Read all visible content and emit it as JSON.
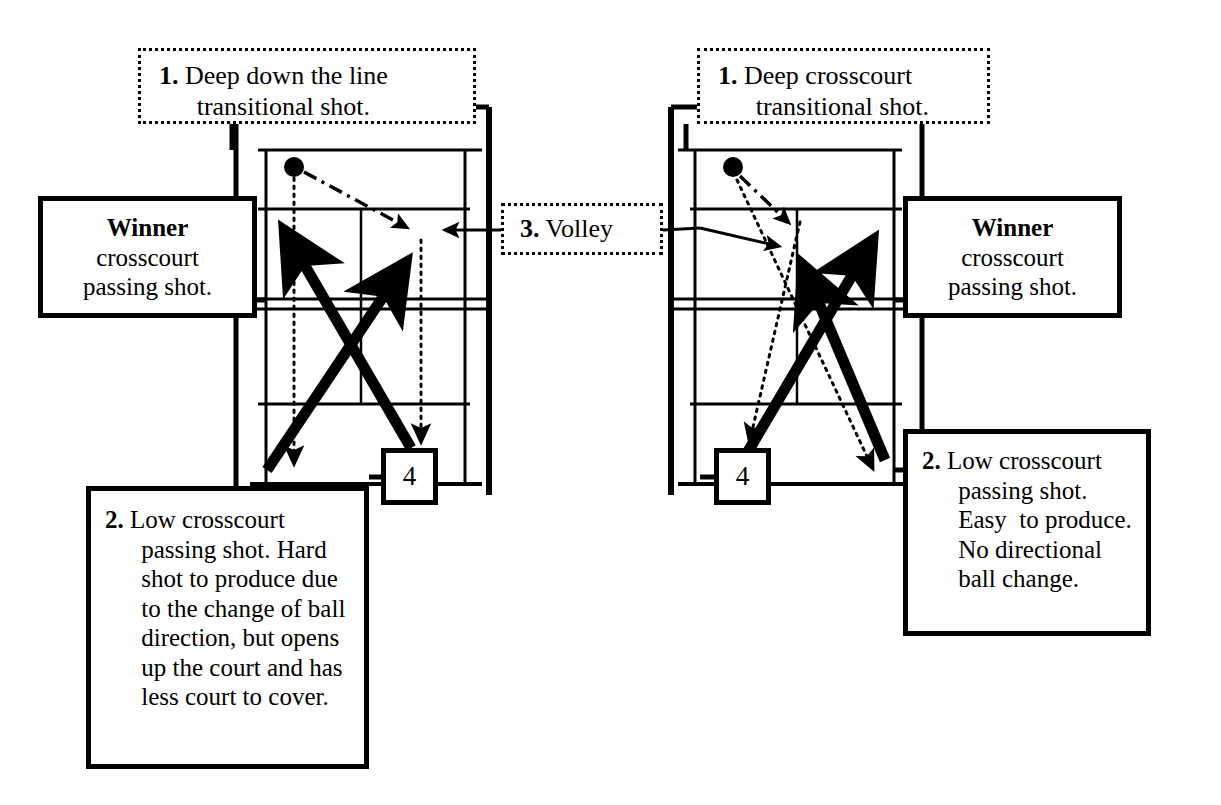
{
  "diagram": {
    "ink_color": "#000000",
    "background_color": "#ffffff"
  },
  "left_panel": {
    "callout_1": {
      "number": "1.",
      "text": "Deep down the line transitional shot.",
      "line1": "Deep down the line",
      "line2": "transitional shot.",
      "border_style": "dotted"
    },
    "winner_box": {
      "heading": "Winner",
      "line2": "crosscourt",
      "line3": "passing shot.",
      "border_style": "solid"
    },
    "callout_2": {
      "number": "2.",
      "text": "Low crosscourt passing shot. Hard shot to produce due to the change of ball direction, but opens up the court and has less court to cover.",
      "border_style": "solid"
    },
    "marker": {
      "label": "4"
    }
  },
  "center": {
    "callout_3": {
      "number": "3.",
      "text": "Volley",
      "border_style": "dotted"
    }
  },
  "right_panel": {
    "callout_1": {
      "number": "1.",
      "text": "Deep crosscourt transitional shot.",
      "line1": "Deep crosscourt",
      "line2": "transitional shot.",
      "border_style": "dotted"
    },
    "winner_box": {
      "heading": "Winner",
      "line2": "crosscourt",
      "line3": "passing shot.",
      "border_style": "solid"
    },
    "callout_2": {
      "number": "2.",
      "text": "Low crosscourt passing shot. Easy  to produce. No directional ball change.",
      "border_style": "solid"
    },
    "marker": {
      "label": "4"
    }
  },
  "court_elements": {
    "ball_marker": "filled-circle",
    "shot_line_styles": [
      "solid-thick-arrow",
      "dashed-arrow",
      "dotted-arrow"
    ],
    "net": "double-horizontal-line"
  }
}
